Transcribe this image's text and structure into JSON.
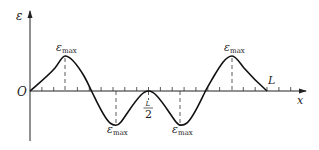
{
  "diagram": {
    "type": "strain-distribution-curve",
    "axes": {
      "y_label": "ε",
      "x_label": "x",
      "origin_label": "O"
    },
    "markers": {
      "half_length_numerator": "L",
      "half_length_denominator": "2",
      "end_label": "L"
    },
    "extrema": [
      {
        "kind": "peak",
        "symbol": "ε",
        "subscript": "max",
        "position": "≈L/8"
      },
      {
        "kind": "trough",
        "symbol": "ε",
        "subscript": "max",
        "position": "≈3L/8"
      },
      {
        "kind": "trough",
        "symbol": "ε",
        "subscript": "max",
        "position": "≈5L/8"
      },
      {
        "kind": "peak",
        "symbol": "ε",
        "subscript": "max",
        "position": "≈7L/8"
      }
    ],
    "colors": {
      "line": "#111111",
      "background": "#ffffff"
    }
  }
}
